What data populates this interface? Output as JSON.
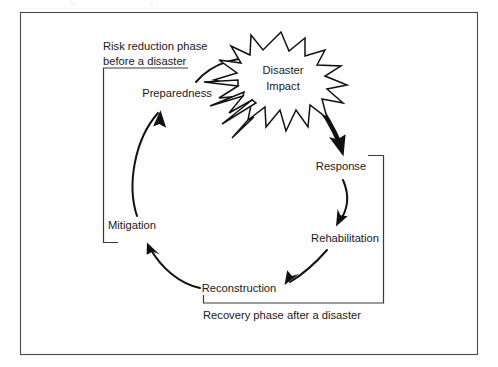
{
  "figure": {
    "background_color": "#fefefe",
    "border_color": "#4a4a4a",
    "ink_color": "#111111"
  },
  "nodes": [
    {
      "id": "preparedness",
      "label": "Preparedness",
      "x": 177,
      "y": 94
    },
    {
      "id": "disaster_impact",
      "label_line1": "Disaster",
      "label_line2": "Impact",
      "x": 283,
      "y": 78
    },
    {
      "id": "response",
      "label": "Response",
      "x": 341,
      "y": 167
    },
    {
      "id": "rehabilitation",
      "label": "Rehabilitation",
      "x": 345,
      "y": 239
    },
    {
      "id": "reconstruction",
      "label": "Reconstruction",
      "x": 239,
      "y": 289
    },
    {
      "id": "mitigation",
      "label": "Mitigation",
      "x": 132,
      "y": 226
    }
  ],
  "annotations": {
    "risk_phase_line1": "Risk reduction phase",
    "risk_phase_line2": "before a disaster",
    "recovery_phase": "Recovery phase after a disaster"
  },
  "flow": [
    {
      "from": "mitigation",
      "to": "preparedness",
      "style": "thin-arc"
    },
    {
      "from": "preparedness",
      "to": "disaster_impact",
      "style": "thin-arc"
    },
    {
      "from": "disaster_impact",
      "to": "response",
      "style": "thick-arrow"
    },
    {
      "from": "response",
      "to": "rehabilitation",
      "style": "thin-arc"
    },
    {
      "from": "rehabilitation",
      "to": "reconstruction",
      "style": "thin-arc"
    },
    {
      "from": "reconstruction",
      "to": "mitigation",
      "style": "thin-arc"
    }
  ]
}
